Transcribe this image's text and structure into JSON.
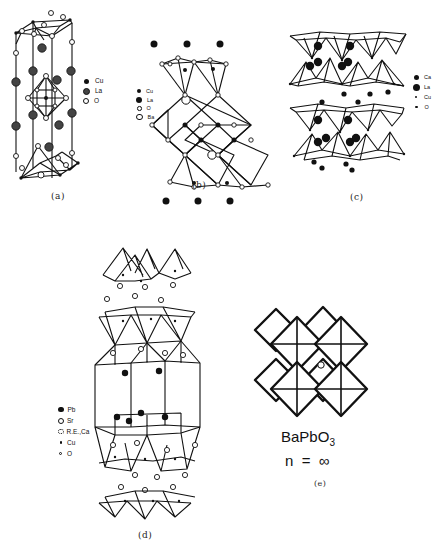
{
  "figure": {
    "panels": [
      {
        "id": "a",
        "caption": "(a)",
        "legend": [
          {
            "symbol": "small-filled-circle",
            "label": "Cu"
          },
          {
            "symbol": "large-hatched-circle",
            "label": "La"
          },
          {
            "symbol": "open-circle",
            "label": "O"
          }
        ]
      },
      {
        "id": "b",
        "caption": "(b)",
        "legend": [
          {
            "symbol": "small-filled-circle",
            "label": "Cu"
          },
          {
            "symbol": "large-filled-circle",
            "label": "La"
          },
          {
            "symbol": "small-open-circle",
            "label": "O"
          },
          {
            "symbol": "large-open-circle",
            "label": "Ba"
          }
        ]
      },
      {
        "id": "c",
        "caption": "(c)",
        "legend": [
          {
            "symbol": "filled-circle",
            "label": "Ca"
          },
          {
            "symbol": "large-filled-circle",
            "label": "La"
          },
          {
            "symbol": "dot",
            "label": "Cu"
          },
          {
            "symbol": "dot",
            "label": "O"
          }
        ]
      },
      {
        "id": "d",
        "caption": "(d)",
        "legend": [
          {
            "symbol": "filled-circle",
            "label": "Pb"
          },
          {
            "symbol": "hatched-circle",
            "label": "Sr"
          },
          {
            "symbol": "dotted-open-circle",
            "label": "R.E.,Ca"
          },
          {
            "symbol": "dot",
            "label": "Cu"
          },
          {
            "symbol": "small-open-dot",
            "label": "O"
          }
        ]
      },
      {
        "id": "e",
        "caption": "(e)",
        "formula_main": "BaPbO",
        "formula_sub": "3",
        "n_label": "n  =  ∞"
      }
    ]
  }
}
